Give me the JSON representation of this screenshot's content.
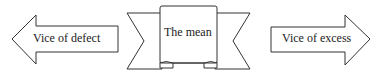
{
  "diagram": {
    "left_arrow": {
      "label": "Vice of defect",
      "direction": "left"
    },
    "center_ribbon": {
      "label": "The mean"
    },
    "right_arrow": {
      "label": "Vice of excess",
      "direction": "right"
    }
  },
  "colors": {
    "stroke": "#333333",
    "fill": "#ffffff",
    "text": "#222222"
  }
}
